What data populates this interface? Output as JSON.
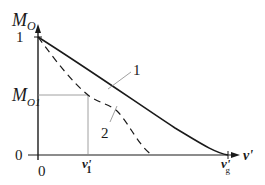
{
  "diagram": {
    "type": "function-plot",
    "y_axis": {
      "label_main": "M",
      "label_sub": "O",
      "tick_top": "1",
      "tick_zero": "0"
    },
    "x_axis": {
      "label": "ν'",
      "tick_zero": "0",
      "tick_v1_main": "ν'",
      "tick_v1_sub": "1",
      "tick_vg_main": "ν'",
      "tick_vg_sub": "g"
    },
    "marker": {
      "label_main": "M",
      "label_sub": "O1"
    },
    "curves": [
      {
        "id": "1",
        "label": "1",
        "style": "solid",
        "description": "M_O decreasing from 1 at ν'=0 to 0 at ν'_g"
      },
      {
        "id": "2",
        "label": "2",
        "style": "dashed",
        "description": "M_O decreasing faster, passing through (ν'_1, M_O1)"
      }
    ],
    "colors": {
      "line": "#1a1a1a",
      "guide": "#888888"
    }
  }
}
